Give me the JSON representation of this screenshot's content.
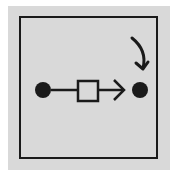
{
  "diagram": {
    "colors": {
      "background": "#d9d9d9",
      "stroke": "#1a1a1a",
      "box_fill": "#d9d9d9"
    },
    "nodes": [
      {
        "id": "source",
        "shape": "circle",
        "filled": true
      },
      {
        "id": "process",
        "shape": "square",
        "filled": false
      },
      {
        "id": "target",
        "shape": "circle",
        "filled": true
      }
    ],
    "edges": [
      {
        "from": "source",
        "to": "process",
        "arrow": false
      },
      {
        "from": "process",
        "to": "target",
        "arrow": true
      }
    ],
    "annotations": [
      {
        "type": "curved-arrow",
        "points_to": "target"
      }
    ]
  }
}
